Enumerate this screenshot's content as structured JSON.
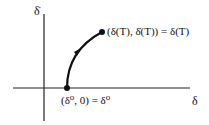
{
  "figure": {
    "type": "phase-plane trajectory diagram",
    "axes": {
      "x_label": "δ",
      "y_label": "δ̇"
    },
    "points": {
      "start": {
        "label": "(δ⁰, 0) = δ⁰"
      },
      "end": {
        "label": "(δ(T), δ̇(T)) = δ(T)"
      }
    },
    "trajectory": {
      "direction": "from start point on δ-axis curving up and right to end point"
    },
    "colors": {
      "ink": "#111111",
      "background": "#ffffff"
    }
  }
}
